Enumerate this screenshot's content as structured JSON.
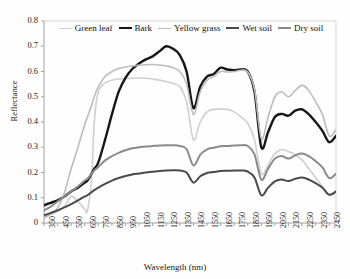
{
  "axes": {
    "xlabel": "Wavelength (nm)",
    "ylabel": "Reflectance",
    "yticks": [
      "0",
      "0.1",
      "0.2",
      "0.3",
      "0.4",
      "0.5",
      "0.6",
      "0.7",
      "0.8"
    ],
    "xticks": [
      "350",
      "450",
      "550",
      "650",
      "750",
      "850",
      "950",
      "1050",
      "1150",
      "1250",
      "1350",
      "1450",
      "1550",
      "1650",
      "1750",
      "1850",
      "1950",
      "2050",
      "2150",
      "2250",
      "2350",
      "2450"
    ]
  },
  "legend": [
    {
      "label": "Green leaf",
      "color": "#d0d0d0",
      "width": 1.6
    },
    {
      "label": "Bark",
      "color": "#161616",
      "width": 2.4
    },
    {
      "label": "Yellow grass",
      "color": "#bdbdbd",
      "width": 1.6
    },
    {
      "label": "Wet soil",
      "color": "#4a4a4a",
      "width": 2.0
    },
    {
      "label": "Dry soil",
      "color": "#8a8a8a",
      "width": 2.0
    }
  ],
  "chart_data": {
    "type": "line",
    "title": "",
    "xlabel": "Wavelength (nm)",
    "ylabel": "Reflectance",
    "xlim": [
      350,
      2500
    ],
    "ylim": [
      0,
      0.8
    ],
    "grid": false,
    "legend_position": "top-center",
    "x": [
      350,
      400,
      450,
      500,
      550,
      600,
      650,
      670,
      700,
      720,
      750,
      800,
      850,
      900,
      950,
      1000,
      1050,
      1100,
      1150,
      1200,
      1250,
      1300,
      1350,
      1400,
      1450,
      1500,
      1550,
      1600,
      1650,
      1700,
      1750,
      1800,
      1850,
      1900,
      1950,
      2000,
      2050,
      2100,
      2150,
      2200,
      2250,
      2300,
      2350,
      2400,
      2450,
      2500
    ],
    "series": [
      {
        "name": "Green leaf",
        "color": "#d0d0d0",
        "width": 1.6,
        "values": [
          0.025,
          0.035,
          0.045,
          0.065,
          0.105,
          0.085,
          0.055,
          0.048,
          0.175,
          0.4,
          0.52,
          0.555,
          0.565,
          0.57,
          0.572,
          0.573,
          0.574,
          0.573,
          0.57,
          0.566,
          0.56,
          0.552,
          0.54,
          0.48,
          0.33,
          0.4,
          0.44,
          0.45,
          0.452,
          0.45,
          0.44,
          0.42,
          0.395,
          0.33,
          0.195,
          0.23,
          0.275,
          0.29,
          0.283,
          0.27,
          0.25,
          0.215,
          0.18,
          0.145,
          0.11,
          0.12
        ]
      },
      {
        "name": "Bark",
        "color": "#161616",
        "width": 2.4,
        "values": [
          0.07,
          0.08,
          0.09,
          0.105,
          0.125,
          0.14,
          0.16,
          0.168,
          0.195,
          0.215,
          0.24,
          0.33,
          0.43,
          0.52,
          0.575,
          0.61,
          0.632,
          0.648,
          0.66,
          0.68,
          0.7,
          0.69,
          0.665,
          0.6,
          0.455,
          0.54,
          0.58,
          0.59,
          0.615,
          0.608,
          0.605,
          0.608,
          0.6,
          0.52,
          0.3,
          0.36,
          0.42,
          0.432,
          0.425,
          0.445,
          0.45,
          0.43,
          0.4,
          0.365,
          0.32,
          0.345
        ]
      },
      {
        "name": "Yellow grass",
        "color": "#bdbdbd",
        "width": 1.6,
        "values": [
          0.02,
          0.035,
          0.06,
          0.12,
          0.215,
          0.3,
          0.39,
          0.42,
          0.465,
          0.5,
          0.54,
          0.58,
          0.6,
          0.612,
          0.618,
          0.622,
          0.625,
          0.627,
          0.628,
          0.626,
          0.622,
          0.615,
          0.6,
          0.55,
          0.43,
          0.52,
          0.565,
          0.58,
          0.6,
          0.598,
          0.6,
          0.605,
          0.598,
          0.53,
          0.335,
          0.42,
          0.5,
          0.52,
          0.5,
          0.525,
          0.545,
          0.525,
          0.48,
          0.43,
          0.345,
          0.37
        ]
      },
      {
        "name": "Wet soil",
        "color": "#4a4a4a",
        "width": 2.0,
        "values": [
          0.03,
          0.04,
          0.05,
          0.062,
          0.075,
          0.09,
          0.105,
          0.11,
          0.122,
          0.13,
          0.14,
          0.155,
          0.168,
          0.178,
          0.186,
          0.192,
          0.196,
          0.2,
          0.203,
          0.206,
          0.208,
          0.209,
          0.208,
          0.2,
          0.16,
          0.185,
          0.198,
          0.202,
          0.206,
          0.207,
          0.208,
          0.208,
          0.204,
          0.18,
          0.11,
          0.14,
          0.165,
          0.172,
          0.166,
          0.175,
          0.18,
          0.172,
          0.158,
          0.14,
          0.112,
          0.125
        ]
      },
      {
        "name": "Dry soil",
        "color": "#8a8a8a",
        "width": 2.0,
        "values": [
          0.05,
          0.065,
          0.085,
          0.105,
          0.125,
          0.145,
          0.168,
          0.175,
          0.195,
          0.208,
          0.222,
          0.248,
          0.265,
          0.278,
          0.288,
          0.296,
          0.3,
          0.303,
          0.305,
          0.307,
          0.308,
          0.308,
          0.305,
          0.292,
          0.228,
          0.27,
          0.292,
          0.298,
          0.304,
          0.305,
          0.307,
          0.308,
          0.305,
          0.272,
          0.172,
          0.215,
          0.255,
          0.265,
          0.255,
          0.268,
          0.275,
          0.265,
          0.245,
          0.22,
          0.178,
          0.195
        ]
      }
    ]
  }
}
